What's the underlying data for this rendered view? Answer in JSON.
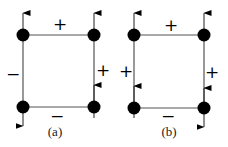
{
  "figure": {
    "panels": [
      {
        "id": "a",
        "caption": "(a)",
        "nodes": {
          "top_left": {
            "x": 23,
            "y": 35
          },
          "top_right": {
            "x": 94,
            "y": 35
          },
          "bottom_left": {
            "x": 23,
            "y": 107
          },
          "bottom_right": {
            "x": 94,
            "y": 107
          }
        },
        "edge_signs": {
          "top": "+",
          "bottom": "−",
          "left": "−",
          "right": "+"
        },
        "arrows": {
          "top_left": "up",
          "top_right": "up",
          "bottom_left": "down",
          "bottom_right": "up"
        }
      },
      {
        "id": "b",
        "caption": "(b)",
        "nodes": {
          "top_left": {
            "x": 134,
            "y": 35
          },
          "top_right": {
            "x": 204,
            "y": 35
          },
          "bottom_left": {
            "x": 134,
            "y": 108
          },
          "bottom_right": {
            "x": 204,
            "y": 108
          }
        },
        "edge_signs": {
          "top": "+",
          "bottom": "−",
          "left": "+",
          "right": "+"
        },
        "arrows": {
          "top_left": "up",
          "top_right": "up",
          "bottom_left": "up",
          "bottom_right": "down"
        }
      }
    ]
  }
}
